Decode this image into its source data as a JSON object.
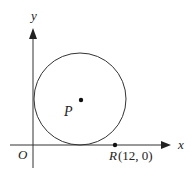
{
  "diagram": {
    "type": "coordinate-geometry",
    "axes": {
      "x_label": "x",
      "y_label": "y",
      "origin_label": "O"
    },
    "circle": {
      "center_label": "P",
      "tangent_to": [
        "x-axis",
        "y-axis"
      ]
    },
    "points": [
      {
        "name": "P",
        "label": "P",
        "role": "circle centre"
      },
      {
        "name": "R",
        "label": "R",
        "coords_text": "(12, 0)",
        "x": 12,
        "y": 0
      }
    ],
    "colors": {
      "stroke": "#333333",
      "background": "#ffffff"
    }
  }
}
